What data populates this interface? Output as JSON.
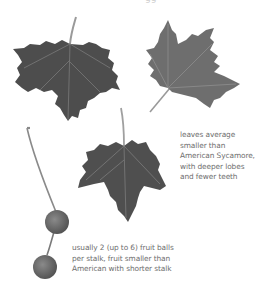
{
  "figure": {
    "top_text_fragment": "gg",
    "captions": {
      "leaves": {
        "lines": [
          "leaves average",
          "smaller than",
          "American Sycamore,",
          "with deeper lobes",
          "and fewer teeth"
        ]
      },
      "fruit": {
        "lines": [
          "usually 2 (up to 6) fruit balls",
          "per stalk, fruit smaller than",
          "American with shorter stalk"
        ]
      }
    },
    "colors": {
      "background": "#ffffff",
      "leaf_dark": "#4a4a4a",
      "leaf_mid": "#6f6f6f",
      "fruit": "#6a6a6a",
      "text": "#6e6e6e"
    }
  }
}
